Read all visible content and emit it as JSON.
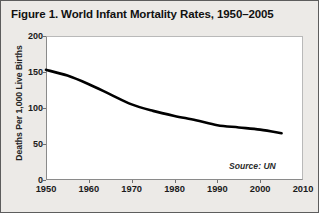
{
  "figure": {
    "title": "Figure 1. World Infant Mortality Rates, 1950–2005",
    "source_note": "Source: UN",
    "frame_color": "#5d5d5d",
    "background_color": "#eceae7",
    "plot_background_color": "#ffffff",
    "line_color": "#000000"
  },
  "chart_data": {
    "type": "line",
    "title": "Figure 1. World Infant Mortality Rates, 1950–2005",
    "subtitle": "",
    "xlabel": "",
    "ylabel": "Deaths Per 1,000 Live Births",
    "xlim": [
      1950,
      2010
    ],
    "ylim": [
      0,
      200
    ],
    "xticks": [
      1950,
      1960,
      1970,
      1980,
      1990,
      2000,
      2010
    ],
    "xtick_labels": [
      "1950",
      "1960",
      "1970",
      "1980",
      "1990",
      "2000",
      "2010"
    ],
    "yticks": [
      0,
      50,
      100,
      150,
      200
    ],
    "ytick_labels": [
      "0",
      "50",
      "100",
      "150",
      "200"
    ],
    "grid": false,
    "legend": false,
    "legend_position": "none",
    "annotations": [
      {
        "text": "Source: UN",
        "x": 2002,
        "y": 22,
        "style": "italic"
      }
    ],
    "series": [
      {
        "name": "World infant mortality rate",
        "units": "deaths per 1,000 live births",
        "x": [
          1950,
          1955,
          1960,
          1965,
          1970,
          1975,
          1980,
          1985,
          1990,
          1995,
          2000,
          2005
        ],
        "values": [
          153,
          145,
          133,
          119,
          105,
          96,
          89,
          83,
          76,
          73,
          70,
          65
        ]
      }
    ]
  }
}
